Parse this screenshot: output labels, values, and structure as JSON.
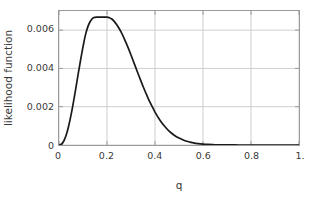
{
  "chart_data": {
    "type": "line",
    "title": "",
    "xlabel": "q",
    "ylabel": "likelihood function",
    "xlim": [
      0,
      1
    ],
    "ylim": [
      0,
      0.007
    ],
    "grid": true,
    "legend": null,
    "x_ticks": [
      {
        "value": 0,
        "label": "0"
      },
      {
        "value": 0.2,
        "label": "0.2"
      },
      {
        "value": 0.4,
        "label": "0.4"
      },
      {
        "value": 0.6,
        "label": "0.6"
      },
      {
        "value": 0.8,
        "label": "0.8"
      },
      {
        "value": 1.0,
        "label": "1."
      }
    ],
    "y_ticks": [
      {
        "value": 0,
        "label": "0"
      },
      {
        "value": 0.002,
        "label": "0.002"
      },
      {
        "value": 0.004,
        "label": "0.004"
      },
      {
        "value": 0.006,
        "label": "0.006"
      }
    ],
    "line_color": "#1a1a1a",
    "grid_color": "#cfcfcf",
    "frame_color": "#9a9a9a",
    "peak": {
      "x": 0.205,
      "y": 0.00668
    },
    "x": [
      0.0,
      0.01,
      0.02,
      0.03,
      0.04,
      0.05,
      0.06,
      0.07,
      0.08,
      0.09,
      0.1,
      0.11,
      0.12,
      0.13,
      0.14,
      0.15,
      0.16,
      0.17,
      0.18,
      0.19,
      0.2,
      0.21,
      0.22,
      0.23,
      0.24,
      0.25,
      0.26,
      0.27,
      0.28,
      0.29,
      0.3,
      0.31,
      0.32,
      0.33,
      0.34,
      0.35,
      0.36,
      0.37,
      0.38,
      0.39,
      0.4,
      0.42,
      0.44,
      0.46,
      0.48,
      0.5,
      0.52,
      0.54,
      0.56,
      0.58,
      0.6,
      0.62,
      0.64,
      0.66,
      0.68,
      0.7,
      0.75,
      0.8,
      0.85,
      0.9,
      0.95,
      1.0
    ],
    "y": [
      0.0,
      4e-05,
      0.00021,
      0.00052,
      0.00098,
      0.00156,
      0.00223,
      0.00296,
      0.00371,
      0.00444,
      0.00513,
      0.00574,
      0.00617,
      0.00645,
      0.00662,
      0.00667,
      0.00668,
      0.00668,
      0.00668,
      0.00668,
      0.00668,
      0.00665,
      0.00658,
      0.00646,
      0.0063,
      0.0061,
      0.00587,
      0.00561,
      0.00532,
      0.00502,
      0.0047,
      0.00437,
      0.00404,
      0.00371,
      0.00339,
      0.00307,
      0.00277,
      0.00248,
      0.00221,
      0.00196,
      0.00172,
      0.00131,
      0.00098,
      0.00071,
      0.00051,
      0.00036,
      0.00025,
      0.00017,
      0.00011,
      7e-05,
      4.5e-05,
      2.8e-05,
      1.7e-05,
      1e-05,
      6e-06,
      3e-06,
      1e-06,
      4e-07,
      1e-07,
      3e-08,
      1e-08,
      0.0
    ]
  }
}
